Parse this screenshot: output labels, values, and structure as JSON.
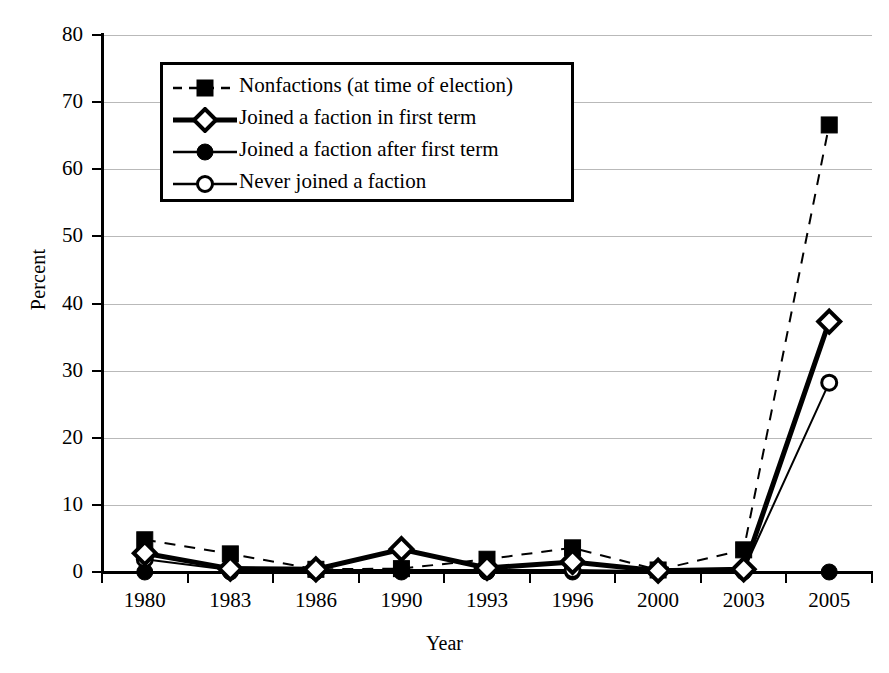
{
  "chart_data": {
    "type": "line",
    "title": "",
    "xlabel": "Year",
    "ylabel": "Percent",
    "categories": [
      "1980",
      "1983",
      "1986",
      "1990",
      "1993",
      "1996",
      "2000",
      "2003",
      "2005"
    ],
    "ylim": [
      0,
      80
    ],
    "ytick_values": [
      0,
      10,
      20,
      30,
      40,
      50,
      60,
      70,
      80
    ],
    "ytick_labels": [
      "0",
      "10",
      "20",
      "30",
      "40",
      "50",
      "60",
      "70",
      "80"
    ],
    "grid": "horizontal",
    "legend_position": "upper-left-inside",
    "series": [
      {
        "name": "Nonfactions (at time of election)",
        "marker": "filled-square",
        "line_style": "dashed",
        "line_width": 2,
        "color": "#000000",
        "values": [
          4.8,
          2.7,
          0.4,
          0.5,
          1.9,
          3.6,
          0.3,
          3.3,
          66.6
        ]
      },
      {
        "name": "Joined a faction in first term",
        "marker": "open-diamond",
        "line_style": "solid",
        "line_width": 5,
        "color": "#000000",
        "values": [
          2.8,
          0.5,
          0.4,
          3.4,
          0.6,
          1.5,
          0.2,
          0.4,
          37.3
        ]
      },
      {
        "name": "Joined a faction after first term",
        "marker": "filled-circle",
        "line_style": "solid",
        "line_width": 2,
        "color": "#000000",
        "values": [
          0.0,
          0.0,
          0.0,
          0.0,
          0.0,
          0.0,
          0.0,
          0.0,
          0.0
        ]
      },
      {
        "name": "Never joined a faction",
        "marker": "open-circle",
        "line_style": "solid",
        "line_width": 2,
        "color": "#000000",
        "values": [
          1.9,
          0.3,
          0.3,
          0.3,
          0.3,
          0.3,
          0.1,
          0.3,
          28.2
        ]
      }
    ]
  },
  "axes": {
    "y_title": "Percent",
    "x_title": "Year"
  },
  "legend": {
    "items": [
      {
        "label": "Nonfactions (at time of election)",
        "key": "dashed-filled-square-key"
      },
      {
        "label": "Joined a faction in first term",
        "key": "thick-open-diamond-key"
      },
      {
        "label": "Joined a faction after first term",
        "key": "solid-filled-circle-key"
      },
      {
        "label": "Never joined a faction",
        "key": "solid-open-circle-key"
      }
    ]
  },
  "colors": {
    "ink": "#000000",
    "gridline": "#b9b9b9",
    "background": "#ffffff"
  }
}
